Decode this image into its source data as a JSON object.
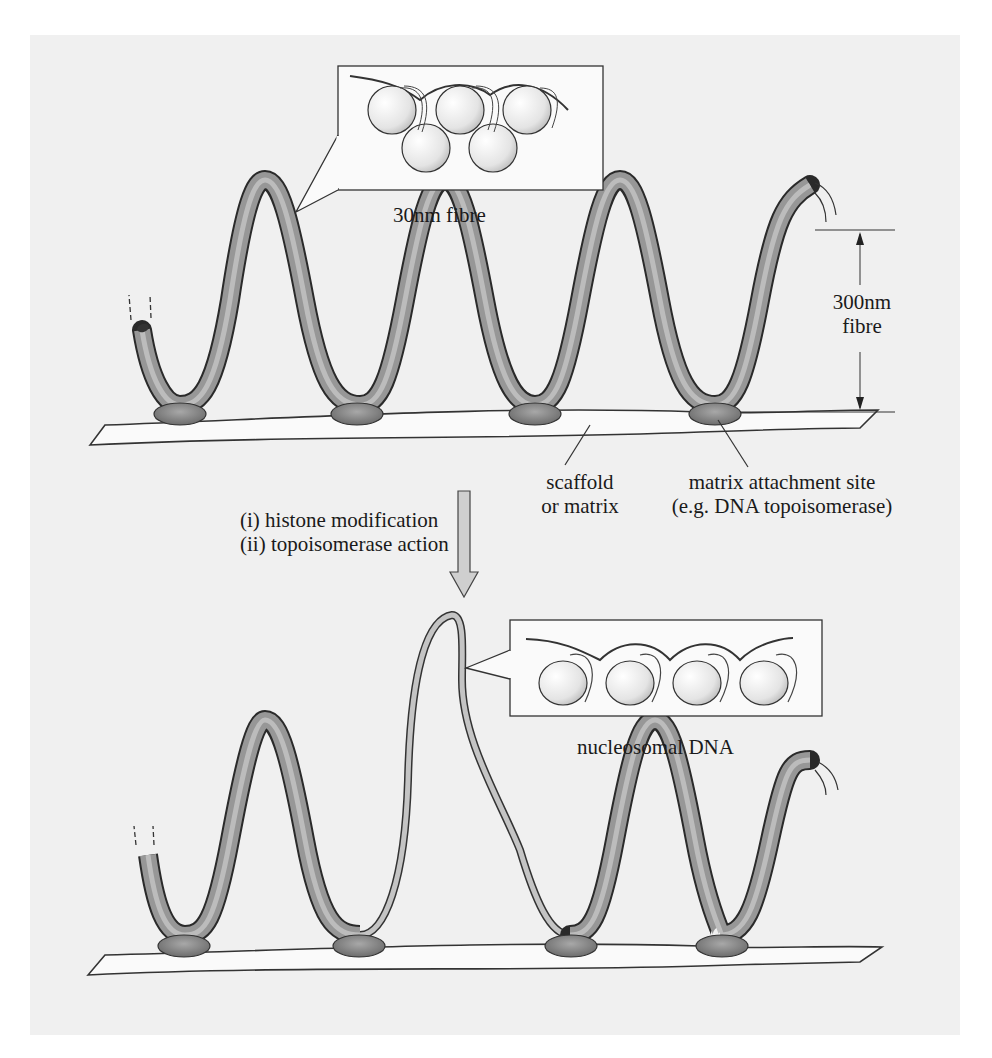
{
  "figure": {
    "background_color": "#f0f0f0",
    "fibre_color": "#8f8f8f",
    "scaffold_color": "#f8f8f8",
    "attachment_color": "#8a8a8a",
    "top_panel": {
      "inset_label": "30nm fibre",
      "dimension_label_line1": "300nm",
      "dimension_label_line2": "fibre",
      "scaffold_label_line1": "scaffold",
      "scaffold_label_line2": "or matrix",
      "attachment_label_line1": "matrix attachment site",
      "attachment_label_line2": "(e.g. DNA topoisomerase)"
    },
    "transition": {
      "step1": "(i) histone modification",
      "step2": "(ii) topoisomerase action",
      "arrow": "down-arrow"
    },
    "bottom_panel": {
      "inset_label": "nucleosomal DNA"
    }
  }
}
